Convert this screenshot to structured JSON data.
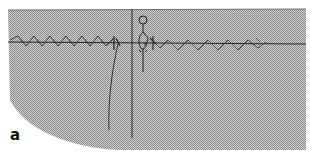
{
  "figure": {
    "panel_label": "a",
    "colors": {
      "background": "#ffffff",
      "halftone_light": "#c8c8c8",
      "halftone_dark": "#8a8a8a",
      "ink": "#222222"
    },
    "elements": [
      "halftone-region",
      "horizontal-axis-line",
      "zigzag-wave-left",
      "zigzag-wave-right",
      "vertical-divider-line",
      "curved-line",
      "stick-figure"
    ]
  }
}
